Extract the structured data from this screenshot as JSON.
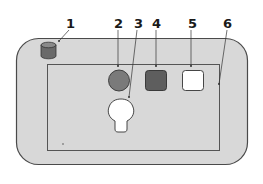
{
  "diagram": {
    "callouts": [
      {
        "id": "1",
        "label": "1",
        "target": "cylinder"
      },
      {
        "id": "2",
        "label": "2",
        "target": "circle"
      },
      {
        "id": "3",
        "label": "3",
        "target": "bulb-keyhole"
      },
      {
        "id": "4",
        "label": "4",
        "target": "dark-square"
      },
      {
        "id": "5",
        "label": "5",
        "target": "white-square"
      },
      {
        "id": "6",
        "label": "6",
        "target": "inner-frame-edge"
      }
    ],
    "colors": {
      "outer_fill": "#d8d8d8",
      "outer_stroke": "#4a4a4a",
      "inner_stroke": "#555555",
      "cylinder_fill": "#6a6a6a",
      "circle_fill": "#7a7a7a",
      "dark_square_fill": "#5e5e5e",
      "white_square_fill": "#ffffff",
      "bulb_fill": "#ffffff"
    }
  }
}
